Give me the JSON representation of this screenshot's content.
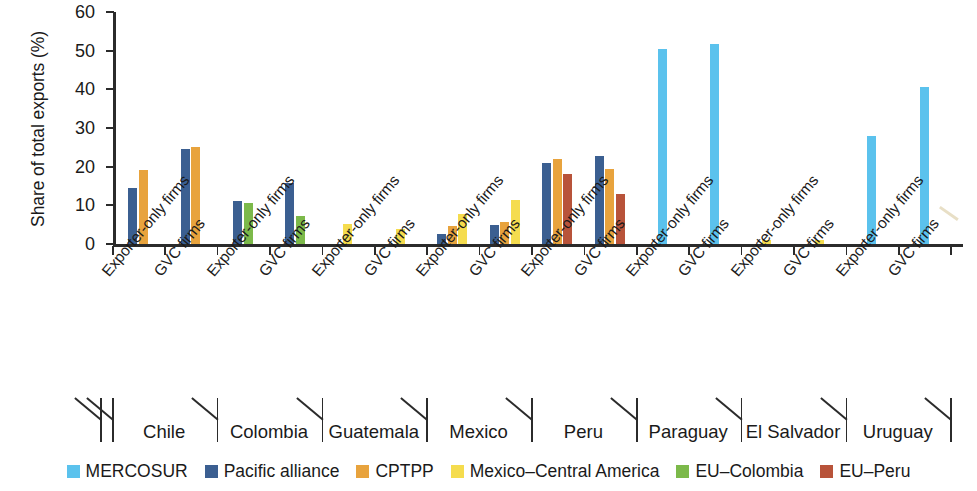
{
  "chart_data": {
    "type": "bar",
    "title": "",
    "xlabel": "",
    "ylabel": "Share of total exports (%)",
    "ylim": [
      0,
      60
    ],
    "yticks": [
      0,
      10,
      20,
      30,
      40,
      50,
      60
    ],
    "ytick_labels": [
      "0",
      "10",
      "20",
      "30",
      "40",
      "50",
      "60"
    ],
    "grid": false,
    "legend_position": "bottom",
    "series": [
      {
        "name": "MERCOSUR",
        "color": "#5bc2ed"
      },
      {
        "name": "Pacific alliance",
        "color": "#3b5f91"
      },
      {
        "name": "CPTPP",
        "color": "#e8a33d"
      },
      {
        "name": "Mexico–Central America",
        "color": "#f5dc4e"
      },
      {
        "name": "EU–Colombia",
        "color": "#7cb94a"
      },
      {
        "name": "EU–Peru",
        "color": "#b8533a"
      }
    ],
    "countries": [
      "Chile",
      "Colombia",
      "Guatemala",
      "Mexico",
      "Peru",
      "Paraguay",
      "El Salvador",
      "Uruguay"
    ],
    "firm_types": [
      "Exporter-only firms",
      "GVC firms"
    ],
    "categories": [
      "Chile — Exporter-only firms",
      "Chile — GVC firms",
      "Colombia — Exporter-only firms",
      "Colombia — GVC firms",
      "Guatemala — Exporter-only firms",
      "Guatemala — GVC firms",
      "Mexico — Exporter-only firms",
      "Mexico — GVC firms",
      "Peru — Exporter-only firms",
      "Peru — GVC firms",
      "Paraguay — Exporter-only firms",
      "Paraguay — GVC firms",
      "El Salvador — Exporter-only firms",
      "El Salvador — GVC firms",
      "Uruguay — Exporter-only firms",
      "Uruguay — GVC firms"
    ],
    "groups": [
      {
        "country": "Chile",
        "firm_type": "Exporter-only firms",
        "values": {
          "MERCOSUR": 0,
          "Pacific alliance": 14.6,
          "CPTPP": 19.2,
          "Mexico–Central America": 0,
          "EU–Colombia": 0,
          "EU–Peru": 0
        }
      },
      {
        "country": "Chile",
        "firm_type": "GVC firms",
        "values": {
          "MERCOSUR": 0,
          "Pacific alliance": 24.5,
          "CPTPP": 25.0,
          "Mexico–Central America": 0,
          "EU–Colombia": 0,
          "EU–Peru": 0
        }
      },
      {
        "country": "Colombia",
        "firm_type": "Exporter-only firms",
        "values": {
          "MERCOSUR": 0,
          "Pacific alliance": 11.2,
          "CPTPP": 0,
          "Mexico–Central America": 0,
          "EU–Colombia": 10.5,
          "EU–Peru": 0
        }
      },
      {
        "country": "Colombia",
        "firm_type": "GVC firms",
        "values": {
          "MERCOSUR": 0,
          "Pacific alliance": 15.8,
          "CPTPP": 0,
          "Mexico–Central America": 0,
          "EU–Colombia": 7.2,
          "EU–Peru": 0
        }
      },
      {
        "country": "Guatemala",
        "firm_type": "Exporter-only firms",
        "values": {
          "MERCOSUR": 0,
          "Pacific alliance": 0,
          "CPTPP": 0,
          "Mexico–Central America": 5.1,
          "EU–Colombia": 0,
          "EU–Peru": 0
        }
      },
      {
        "country": "Guatemala",
        "firm_type": "GVC firms",
        "values": {
          "MERCOSUR": 0,
          "Pacific alliance": 0,
          "CPTPP": 0,
          "Mexico–Central America": 4.0,
          "EU–Colombia": 0,
          "EU–Peru": 0
        }
      },
      {
        "country": "Mexico",
        "firm_type": "Exporter-only firms",
        "values": {
          "MERCOSUR": 0,
          "Pacific alliance": 2.6,
          "CPTPP": 4.6,
          "Mexico–Central America": 7.8,
          "EU–Colombia": 0,
          "EU–Peru": 0
        }
      },
      {
        "country": "Mexico",
        "firm_type": "GVC firms",
        "values": {
          "MERCOSUR": 0,
          "Pacific alliance": 5.0,
          "CPTPP": 5.8,
          "Mexico–Central America": 11.5,
          "EU–Colombia": 0,
          "EU–Peru": 0
        }
      },
      {
        "country": "Peru",
        "firm_type": "Exporter-only firms",
        "values": {
          "MERCOSUR": 0,
          "Pacific alliance": 21.0,
          "CPTPP": 22.0,
          "Mexico–Central America": 0,
          "EU–Colombia": 0,
          "EU–Peru": 18.2
        }
      },
      {
        "country": "Peru",
        "firm_type": "GVC firms",
        "values": {
          "MERCOSUR": 0,
          "Pacific alliance": 22.8,
          "CPTPP": 19.4,
          "Mexico–Central America": 0,
          "EU–Colombia": 0,
          "EU–Peru": 13.0
        }
      },
      {
        "country": "Paraguay",
        "firm_type": "Exporter-only firms",
        "values": {
          "MERCOSUR": 50.4,
          "Pacific alliance": 0,
          "CPTPP": 0,
          "Mexico–Central America": 0,
          "EU–Colombia": 0,
          "EU–Peru": 0
        }
      },
      {
        "country": "Paraguay",
        "firm_type": "GVC firms",
        "values": {
          "MERCOSUR": 51.6,
          "Pacific alliance": 0,
          "CPTPP": 0,
          "Mexico–Central America": 0,
          "EU–Colombia": 0,
          "EU–Peru": 0
        }
      },
      {
        "country": "El Salvador",
        "firm_type": "Exporter-only firms",
        "values": {
          "MERCOSUR": 0,
          "Pacific alliance": 0,
          "CPTPP": 0,
          "Mexico–Central America": 1.1,
          "EU–Colombia": 0,
          "EU–Peru": 0
        }
      },
      {
        "country": "El Salvador",
        "firm_type": "GVC firms",
        "values": {
          "MERCOSUR": 0,
          "Pacific alliance": 0,
          "CPTPP": 0,
          "Mexico–Central America": 1.0,
          "EU–Colombia": 0,
          "EU–Peru": 0
        }
      },
      {
        "country": "Uruguay",
        "firm_type": "Exporter-only firms",
        "values": {
          "MERCOSUR": 28.0,
          "Pacific alliance": 0,
          "CPTPP": 0,
          "Mexico–Central America": 0,
          "EU–Colombia": 0,
          "EU–Peru": 0
        }
      },
      {
        "country": "Uruguay",
        "firm_type": "GVC firms",
        "values": {
          "MERCOSUR": 40.5,
          "Pacific alliance": 0,
          "CPTPP": 0,
          "Mexico–Central America": 0,
          "EU–Colombia": 0,
          "EU–Peru": 0
        }
      }
    ]
  }
}
